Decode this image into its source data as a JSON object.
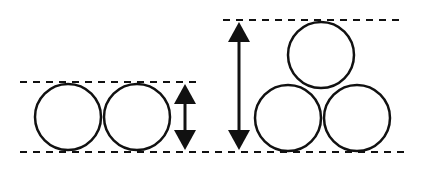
{
  "diagram": {
    "title": "",
    "colors": {
      "stroke": "#111111",
      "background": "#ffffff"
    },
    "left_group": {
      "circles": [
        {
          "cx": 68,
          "cy": 117,
          "r": 33
        },
        {
          "cx": 137,
          "cy": 117,
          "r": 33
        }
      ],
      "top_line": {
        "x1": 20,
        "x2": 202,
        "y": 82
      },
      "bottom_line": {
        "x1": 20,
        "x2": 410,
        "y": 152
      },
      "arrow": {
        "x": 185,
        "y1": 84,
        "y2": 150
      }
    },
    "right_group": {
      "circles": [
        {
          "cx": 321,
          "cy": 55,
          "r": 33
        },
        {
          "cx": 288,
          "cy": 118,
          "r": 33
        },
        {
          "cx": 357,
          "cy": 118,
          "r": 33
        }
      ],
      "top_line": {
        "x1": 223,
        "x2": 405,
        "y": 20
      },
      "arrow": {
        "x": 239,
        "y1": 22,
        "y2": 150
      }
    }
  }
}
